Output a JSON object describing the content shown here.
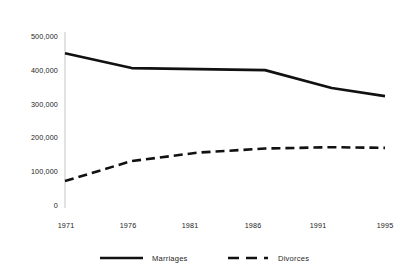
{
  "chart_data": {
    "type": "line",
    "title": "",
    "subtitle": "",
    "xlabel": "",
    "ylabel": "",
    "x": [
      1971,
      1976,
      1981,
      1986,
      1991,
      1995
    ],
    "categories": [
      "1971",
      "1976",
      "1981",
      "1986",
      "1991",
      "1995"
    ],
    "series": [
      {
        "name": "Marriages",
        "style": "solid",
        "color": "#111111",
        "values": [
          452000,
          408000,
          405000,
          402000,
          349000,
          325000
        ]
      },
      {
        "name": "Divorces",
        "style": "dashed",
        "color": "#111111",
        "values": [
          74000,
          133000,
          158000,
          170000,
          174000,
          172000
        ]
      }
    ],
    "ylim": [
      0,
      500000
    ],
    "xlim": [
      1971,
      1995
    ],
    "yticks": [
      0,
      100000,
      200000,
      300000,
      400000,
      500000
    ],
    "ytick_labels": [
      "0",
      "100,000",
      "200,000",
      "300,000",
      "400,000",
      "500,000"
    ],
    "xtick_labels": [
      "1971",
      "1976",
      "1981",
      "1986",
      "1991",
      "1995"
    ],
    "grid": false,
    "legend_position": "bottom",
    "legend": [
      {
        "label": "Marriages",
        "style": "solid"
      },
      {
        "label": "Divorces",
        "style": "dashed"
      }
    ]
  },
  "axes": {
    "y_ticks": [
      {
        "label": "500,000",
        "value": 500000
      },
      {
        "label": "400,000",
        "value": 400000
      },
      {
        "label": "300,000",
        "value": 300000
      },
      {
        "label": "200,000",
        "value": 200000
      },
      {
        "label": "100,000",
        "value": 100000
      },
      {
        "label": "0",
        "value": 0
      }
    ],
    "x_ticks": [
      {
        "label": "1971",
        "value": 1971
      },
      {
        "label": "1976",
        "value": 1976
      },
      {
        "label": "1981",
        "value": 1981
      },
      {
        "label": "1986",
        "value": 1986
      },
      {
        "label": "1991",
        "value": 1991
      },
      {
        "label": "1995",
        "value": 1995
      }
    ]
  },
  "legend": {
    "items": [
      {
        "label": "Marriages",
        "style": "solid"
      },
      {
        "label": "Divorces",
        "style": "dashed"
      }
    ]
  },
  "colors": {
    "line": "#111111",
    "axis": "#bdbdbd",
    "text": "#222222",
    "background": "#ffffff"
  }
}
